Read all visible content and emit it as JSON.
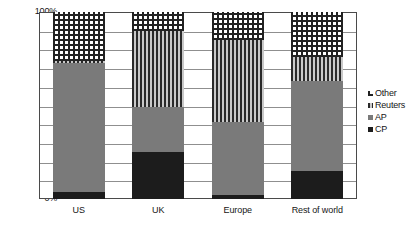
{
  "chart_data": {
    "type": "bar",
    "stacked": true,
    "stack_mode": "percent",
    "title": "",
    "xlabel": "",
    "ylabel": "",
    "ylim": [
      0,
      100
    ],
    "ytick_labels": [
      "100%",
      "90%",
      "80%",
      "70%",
      "60%",
      "50%",
      "40%",
      "30%",
      "20%",
      "10%",
      "0%"
    ],
    "ytick_values": [
      100,
      90,
      80,
      70,
      60,
      50,
      40,
      30,
      20,
      10,
      0
    ],
    "grid": true,
    "grid_axis": "y",
    "legend_position": "right",
    "categories": [
      "US",
      "UK",
      "Europe",
      "Rest of world"
    ],
    "series": [
      {
        "name": "CP",
        "values": [
          4,
          25,
          2,
          15
        ],
        "swatch": "solid-black",
        "color": "#1c1c1c"
      },
      {
        "name": "AP",
        "values": [
          69,
          24,
          39,
          48
        ],
        "swatch": "solid-grey",
        "color": "#7a7a7a"
      },
      {
        "name": "Reuters",
        "values": [
          1,
          41,
          44,
          13
        ],
        "swatch": "vertical-stripe",
        "color": "#2a2a2a"
      },
      {
        "name": "Other",
        "values": [
          26,
          10,
          15,
          24
        ],
        "swatch": "checkerboard",
        "color": "#222222"
      }
    ],
    "legend_entries": [
      "Other",
      "Reuters",
      "AP",
      "CP"
    ],
    "cumulative_tops": {
      "US": [
        4,
        73,
        74,
        100
      ],
      "UK": [
        25,
        49,
        90,
        100
      ],
      "Europe": [
        2,
        41,
        85,
        100
      ],
      "Rest of world": [
        15,
        63,
        76,
        100
      ]
    }
  }
}
